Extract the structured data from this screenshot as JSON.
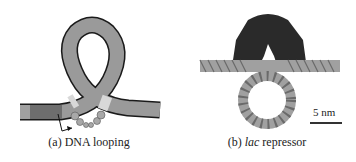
{
  "panels": [
    {
      "id": "a",
      "caption_prefix": "(a)",
      "caption_text": "DNA looping",
      "colors": {
        "dna_main": "#9a9a9a",
        "dna_dark": "#6e6e6e",
        "dna_light": "#d8d8d8",
        "outline": "#1a1a1a",
        "protein": "#a8a8a8"
      }
    },
    {
      "id": "b",
      "caption_prefix": "(b)",
      "caption_italic": "lac",
      "caption_text": "repressor",
      "scale_bar": {
        "label": "5 nm"
      },
      "colors": {
        "protein": "#2a2a2a",
        "dna": "#a0a0a0"
      }
    }
  ]
}
